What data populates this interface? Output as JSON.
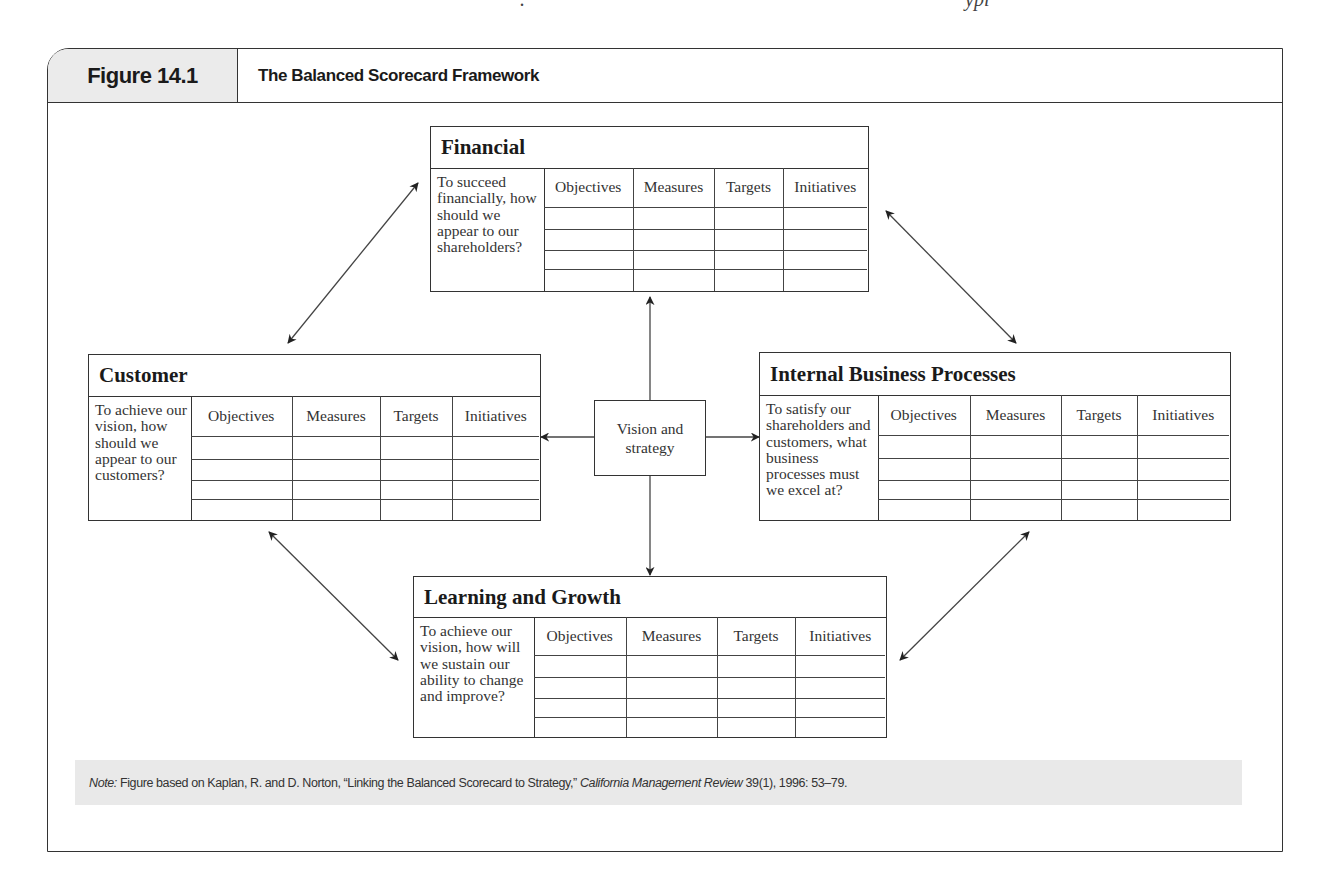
{
  "page": {
    "top_clipped_text": "Figure 14.1 The Balanced Scorecard Framework ... typically"
  },
  "figure": {
    "label": "Figure 14.1",
    "title": "The Balanced Scorecard Framework"
  },
  "center": {
    "label": "Vision and strategy",
    "line1": "Vision and",
    "line2": "strategy"
  },
  "columns": [
    "Objectives",
    "Measures",
    "Targets",
    "Initiatives"
  ],
  "perspectives": {
    "financial": {
      "title": "Financial",
      "question": "To succeed financially, how should we appear to our shareholders?"
    },
    "customer": {
      "title": "Customer",
      "question": "To achieve our vision, how should we appear to our customers?"
    },
    "internal": {
      "title": "Internal Business Processes",
      "question": "To satisfy our shareholders and customers, what business processes must we excel at?"
    },
    "learning": {
      "title": "Learning and Growth",
      "question": "To achieve our vision, how will we sustain our ability to change and improve?"
    }
  },
  "note": {
    "prefix": "Note:",
    "text": " Figure based on Kaplan, R. and D. Norton, “Linking the Balanced Scorecard to Strategy,” ",
    "journal": "California Management Review",
    "citation": " 39(1), 1996: 53–79."
  }
}
